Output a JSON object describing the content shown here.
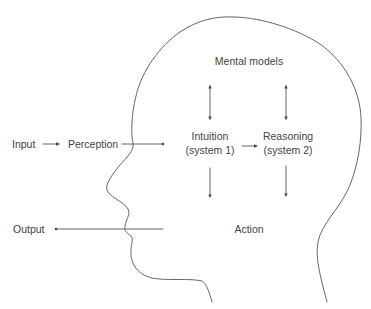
{
  "diagram": {
    "type": "cognitive-process-head-diagram",
    "nodes": {
      "input": "Input",
      "perception": "Perception",
      "mental_models": "Mental models",
      "intuition_line1": "Intuition",
      "intuition_line2": "(system 1)",
      "reasoning_line1": "Reasoning",
      "reasoning_line2": "(system 2)",
      "action": "Action",
      "output": "Output"
    },
    "edges": [
      {
        "from": "Input",
        "to": "Perception",
        "style": "arrow"
      },
      {
        "from": "Perception",
        "to": "Intuition (system 1)",
        "style": "arrow"
      },
      {
        "from": "Mental models",
        "to": "Intuition (system 1)",
        "style": "bidirectional"
      },
      {
        "from": "Mental models",
        "to": "Reasoning (system 2)",
        "style": "bidirectional"
      },
      {
        "from": "Intuition (system 1)",
        "to": "Reasoning (system 2)",
        "style": "arrow"
      },
      {
        "from": "Intuition (system 1)",
        "to": "Action",
        "style": "arrow"
      },
      {
        "from": "Reasoning (system 2)",
        "to": "Action",
        "style": "arrow"
      },
      {
        "from": "Action",
        "to": "Output",
        "style": "arrow"
      }
    ],
    "colors": {
      "line": "#555555",
      "text": "#444444",
      "background": "#ffffff"
    }
  }
}
